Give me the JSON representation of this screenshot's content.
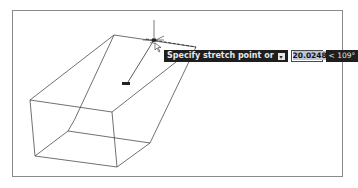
{
  "viewport": {
    "background": "#ffffff",
    "border_color": "#8a8a8a"
  },
  "dynamic_input": {
    "prompt_text": "Specify stretch point or",
    "options_icon": "down-arrow-options-icon",
    "distance_value": "20.0248",
    "angle_text": "< 109°",
    "tooltip_bg": "#1e1e1e",
    "tooltip_fg": "#e6e6e6"
  },
  "cursor": {
    "type": "crosshair-with-pointer",
    "position": [
      154,
      40
    ]
  },
  "grip": {
    "position": [
      126,
      83
    ]
  },
  "wireframe": {
    "stroke": "#333333",
    "vertices": {
      "front_top_left": [
        30,
        100
      ],
      "front_top_right": [
        112,
        112
      ],
      "front_bottom_left": [
        35,
        156
      ],
      "front_bottom_right": [
        117,
        167
      ],
      "back_bottom_left": [
        68,
        131
      ],
      "back_bottom_right": [
        150,
        143
      ],
      "back_top_left": [
        114,
        35
      ],
      "back_top_right": [
        196,
        47
      ]
    }
  }
}
